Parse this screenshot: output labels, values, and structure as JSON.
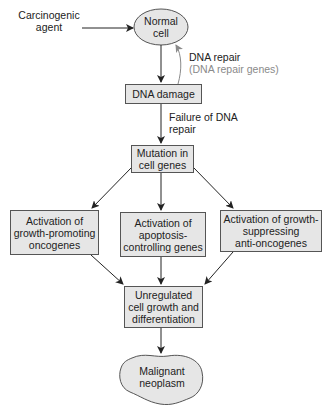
{
  "diagram": {
    "nodes": {
      "carcinogenic_agent": {
        "line1": "Carcinogenic",
        "line2": "agent"
      },
      "normal_cell": {
        "line1": "Normal",
        "line2": "cell"
      },
      "dna_repair": {
        "label": "DNA repair",
        "sublabel": "(DNA repair genes)"
      },
      "dna_damage": {
        "label": "DNA damage"
      },
      "failure_repair": {
        "line1": "Failure of DNA",
        "line2": "repair"
      },
      "mutation": {
        "line1": "Mutation in",
        "line2": "cell genes"
      },
      "activation_oncogenes": {
        "line1": "Activation of",
        "line2": "growth-promoting",
        "line3": "oncogenes"
      },
      "activation_apoptosis": {
        "line1": "Activation of",
        "line2": "apoptosis-",
        "line3": "controlling genes"
      },
      "activation_antioncogenes": {
        "line1": "Activation of growth-",
        "line2": "suppressing",
        "line3": "anti-oncogenes"
      },
      "unregulated": {
        "line1": "Unregulated",
        "line2": "cell growth and",
        "line3": "differentiation"
      },
      "neoplasm": {
        "line1": "Malignant",
        "line2": "neoplasm"
      }
    },
    "colors": {
      "fill": "#e6e6e6",
      "stroke": "#555555",
      "arrow": "#222222",
      "repair_arrow": "#8a8a8a",
      "muted_text": "#8a8a8a"
    }
  }
}
